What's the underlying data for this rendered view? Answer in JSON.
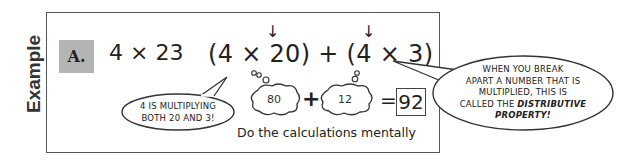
{
  "side_label": "Example",
  "example": {
    "badge": "A.",
    "problem": "4 × 23",
    "expression": {
      "left_group": "(4 × 20)",
      "plus": "+",
      "right_group": "(4 × 3)"
    },
    "arrows": [
      "↓",
      "↓"
    ],
    "thought_clouds": [
      {
        "value": "80"
      },
      {
        "value": "12"
      }
    ],
    "operator_plus": "+",
    "operator_equals": "=",
    "answer": "92",
    "caption": "Do the calculations mentally"
  },
  "speech_bubbles": {
    "left": {
      "lines": [
        "4 IS MULTIPLYING",
        "BOTH 20 AND 3!"
      ]
    },
    "right": {
      "lines": [
        "WHEN YOU BREAK",
        "APART A NUMBER THAT IS",
        "MULTIPLIED, THIS IS",
        "CALLED THE"
      ],
      "emphasis": "DISTRIBUTIVE",
      "emphasis_line2": "PROPERTY!"
    }
  },
  "colors": {
    "badge_bg": "#b4b4b4",
    "frame": "#555555",
    "text": "#222222"
  }
}
